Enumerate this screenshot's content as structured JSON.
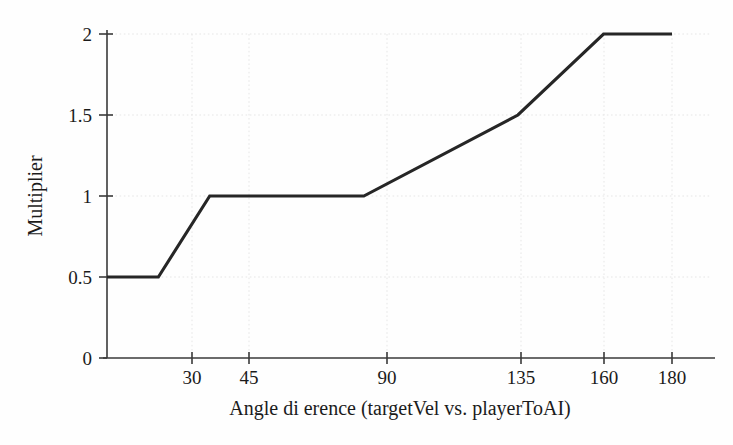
{
  "chart_data": {
    "type": "line",
    "title": "",
    "xlabel": "Angle di erence (targetVel vs. playerToAI)",
    "ylabel": "Multiplier",
    "xlim": [
      15,
      180
    ],
    "ylim": [
      0,
      2
    ],
    "grid": true,
    "legend": false,
    "xticks": [
      30,
      45,
      90,
      135,
      160,
      180
    ],
    "xticklabels": [
      "30",
      "45",
      "90",
      "135",
      "160",
      "180"
    ],
    "yticks": [
      0,
      0.5,
      1,
      1.5,
      2
    ],
    "yticklabels": [
      "0",
      "0.5",
      "1",
      "1.5",
      "2"
    ],
    "series": [
      {
        "name": "Multiplier curve",
        "color": "#262626",
        "x": [
          15,
          30,
          45,
          90,
          135,
          160,
          180
        ],
        "y": [
          0.5,
          0.5,
          1.0,
          1.0,
          1.5,
          2.0,
          2.0
        ]
      }
    ]
  },
  "axes": {
    "x_title": "Angle di erence (targetVel vs. playerToAI)",
    "y_title": "Multiplier"
  },
  "ticks": {
    "x": [
      {
        "value": 30,
        "label": "30"
      },
      {
        "value": 45,
        "label": "45"
      },
      {
        "value": 90,
        "label": "90"
      },
      {
        "value": 135,
        "label": "135"
      },
      {
        "value": 160,
        "label": "160"
      },
      {
        "value": 180,
        "label": "180"
      }
    ],
    "y": [
      {
        "value": 0,
        "label": "0"
      },
      {
        "value": 0.5,
        "label": "0.5"
      },
      {
        "value": 1,
        "label": "1"
      },
      {
        "value": 1.5,
        "label": "1.5"
      },
      {
        "value": 2,
        "label": "2"
      }
    ]
  },
  "colors": {
    "line": "#262626",
    "axis": "#3a3a3a",
    "grid": "#e6e6e6",
    "background": "#fefefe",
    "text": "#1b1b1b"
  }
}
